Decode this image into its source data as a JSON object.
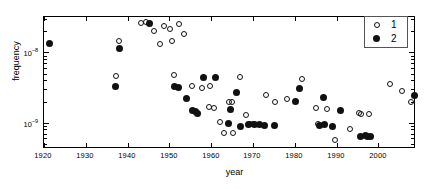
{
  "figure": {
    "title": "",
    "background": "#ffffff"
  },
  "axes": {
    "x": {
      "label": "year",
      "ticks": [
        1920,
        1930,
        1940,
        1950,
        1960,
        1970,
        1980,
        1990,
        2000
      ],
      "tick_labels": [
        "1920",
        "1930",
        "1940",
        "1950",
        "1960",
        "1970",
        "1980",
        "1990",
        "2000"
      ],
      "range": [
        1920,
        2008.5
      ]
    },
    "y": {
      "label": "frequency",
      "scale": "log",
      "tick_labels": [
        "10–8",
        "10–9"
      ],
      "tick_values": [
        1e-08,
        1e-09
      ],
      "range": [
        4.5e-10,
        3.2e-08
      ]
    }
  },
  "legend": {
    "position": "top-right",
    "entries": [
      {
        "label": "1",
        "marker": "open-circle"
      },
      {
        "label": "2",
        "marker": "filled-circle"
      }
    ]
  },
  "chart_data": {
    "type": "scatter",
    "title": "",
    "xlabel": "year",
    "ylabel": "frequency",
    "xlim": [
      1920,
      2008.5
    ],
    "ylim": [
      4.5e-10,
      3.2e-08
    ],
    "yscale": "log",
    "grid": false,
    "legend_position": "top-right",
    "series": [
      {
        "name": "1",
        "marker": "open-circle",
        "points": [
          [
            1938.0,
            1.45e-08
          ],
          [
            1937.2,
            4.55e-09
          ],
          [
            1943.2,
            2.62e-08
          ],
          [
            1944.5,
            2.7e-08
          ],
          [
            1946.3,
            2.05e-08
          ],
          [
            1947.8,
            1.3e-08
          ],
          [
            1948.8,
            2.38e-08
          ],
          [
            1950.2,
            2.14e-08
          ],
          [
            1950.6,
            1.44e-08
          ],
          [
            1952.4,
            2.55e-08
          ],
          [
            1953.6,
            1.85e-08
          ],
          [
            1951.0,
            4.85e-09
          ],
          [
            1955.4,
            3.3e-09
          ],
          [
            1957.8,
            3.1e-09
          ],
          [
            1959.4,
            1.65e-09
          ],
          [
            1960.7,
            1.6e-09
          ],
          [
            1959.8,
            3.3e-09
          ],
          [
            1962.0,
            1.02e-09
          ],
          [
            1963.0,
            7.2e-10
          ],
          [
            1965.3,
            7.1e-10
          ],
          [
            1964.3,
            2e-09
          ],
          [
            1964.9,
            2e-09
          ],
          [
            1966.9,
            4.4e-09
          ],
          [
            1968.2,
            1.3e-09
          ],
          [
            1969.3,
            9.6e-10
          ],
          [
            1970.0,
            9.55e-10
          ],
          [
            1973.0,
            2.45e-09
          ],
          [
            1975.2,
            2e-09
          ],
          [
            1978.1,
            2.18e-09
          ],
          [
            1981.8,
            4.25e-09
          ],
          [
            1985.0,
            1.62e-09
          ],
          [
            1985.5,
            9.45e-10
          ],
          [
            1987.6,
            1.55e-09
          ],
          [
            1989.5,
            5.6e-10
          ],
          [
            1993.2,
            8.05e-10
          ],
          [
            1995.4,
            1.38e-09
          ],
          [
            1995.9,
            1.31e-09
          ],
          [
            1997.8,
            1.35e-09
          ],
          [
            2002.8,
            3.5e-09
          ],
          [
            2005.6,
            2.85e-09
          ],
          [
            2007.9,
            2e-09
          ]
        ]
      },
      {
        "name": "2",
        "marker": "filled-circle",
        "points": [
          [
            1921.4,
            1.32e-08
          ],
          [
            1937.0,
            3.3e-09
          ],
          [
            1938.1,
            1.15e-08
          ],
          [
            1945.2,
            2.62e-08
          ],
          [
            1951.2,
            3.25e-09
          ],
          [
            1952.2,
            3.2e-09
          ],
          [
            1954.2,
            2.22e-09
          ],
          [
            1955.6,
            1.5e-09
          ],
          [
            1956.2,
            1.42e-09
          ],
          [
            1956.8,
            1.37e-09
          ],
          [
            1958.2,
            4.4e-09
          ],
          [
            1961.0,
            4.4e-09
          ],
          [
            1964.6,
            1.52e-09
          ],
          [
            1966.0,
            2.7e-09
          ],
          [
            1964.1,
            9.6e-10
          ],
          [
            1967.0,
            8.9e-10
          ],
          [
            1969.0,
            9.4e-10
          ],
          [
            1970.4,
            9.35e-10
          ],
          [
            1971.6,
            9.3e-10
          ],
          [
            1972.7,
            9.25e-10
          ],
          [
            1975.2,
            9.2e-10
          ],
          [
            1980.1,
            2e-09
          ],
          [
            1981.2,
            3.1e-09
          ],
          [
            1985.8,
            9.05e-10
          ],
          [
            1987.2,
            9.5e-10
          ],
          [
            1986.8,
            2.3e-09
          ],
          [
            1988.9,
            8.7e-10
          ],
          [
            1990.8,
            1.48e-09
          ],
          [
            1995.7,
            6.3e-10
          ],
          [
            1996.8,
            6.55e-10
          ],
          [
            1997.4,
            6.45e-10
          ],
          [
            1998.0,
            6.35e-10
          ],
          [
            2008.6,
            2.4e-09
          ]
        ]
      }
    ]
  }
}
